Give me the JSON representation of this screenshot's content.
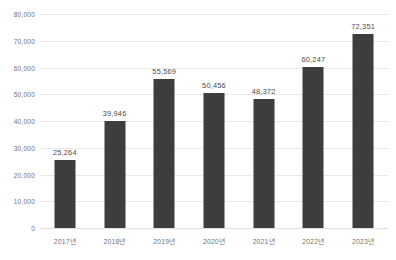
{
  "chart_data": {
    "type": "bar",
    "title": "",
    "xlabel": "",
    "ylabel": "",
    "categories": [
      "2017년",
      "2018년",
      "2019년",
      "2020년",
      "2021년",
      "2022년",
      "2023년"
    ],
    "values": [
      25264,
      39946,
      55569,
      50456,
      48372,
      60247,
      72351
    ],
    "data_labels": [
      "25,264",
      "39,946",
      "55,569",
      "50,456",
      "48,372",
      "60,247",
      "72,351"
    ],
    "ylim": [
      0,
      80000
    ],
    "ytick_values": [
      0,
      10000,
      20000,
      30000,
      40000,
      50000,
      60000,
      70000,
      80000
    ],
    "ytick_labels": [
      "0",
      "10,000",
      "20,000",
      "30,000",
      "40,000",
      "50,000",
      "60,000",
      "70,000",
      "80,000"
    ],
    "grid": true,
    "legend": false,
    "legend_position": "none",
    "series": [
      {
        "name": "",
        "values": [
          25264,
          39946,
          55569,
          50456,
          48372,
          60247,
          72351
        ]
      }
    ]
  },
  "colors": {
    "bar": "#3d3d3d",
    "gridline": "#e8e8e8",
    "axis_text": "#737373",
    "label_text": "#4a4a4a",
    "background": "#ffffff"
  }
}
